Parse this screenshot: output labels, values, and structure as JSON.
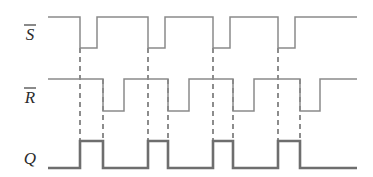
{
  "figure": {
    "type": "timing-diagram",
    "background_color": "#ffffff",
    "signal_color": "#8a8a8a",
    "output_color": "#6e6e6e",
    "dash_color": "#3a3a3a",
    "label_color": "#2b2b2b"
  },
  "axes": {
    "t_start": 48,
    "t_end": 357,
    "levels": {
      "sbar_high_y": 17,
      "sbar_low_y": 48,
      "rbar_high_y": 79,
      "rbar_low_y": 111,
      "q_high_y": 141,
      "q_low_y": 168
    }
  },
  "signals": [
    {
      "name": "S-bar",
      "label": "S",
      "overbar": true,
      "label_x": 30,
      "label_y": 40,
      "idle_level": "high",
      "active_low_pulses": [
        {
          "fall": 80,
          "rise": 97
        },
        {
          "fall": 148,
          "rise": 165
        },
        {
          "fall": 213,
          "rise": 230
        },
        {
          "fall": 278,
          "rise": 295
        }
      ]
    },
    {
      "name": "R-bar",
      "label": "R",
      "overbar": true,
      "label_x": 30,
      "label_y": 103,
      "idle_level": "high",
      "active_low_pulses": [
        {
          "fall": 103,
          "rise": 124
        },
        {
          "fall": 168,
          "rise": 189
        },
        {
          "fall": 233,
          "rise": 254
        },
        {
          "fall": 300,
          "rise": 320
        }
      ]
    },
    {
      "name": "Q",
      "label": "Q",
      "overbar": false,
      "label_x": 30,
      "label_y": 164,
      "idle_level": "low",
      "high_intervals": [
        {
          "rise": 80,
          "fall": 103
        },
        {
          "rise": 148,
          "fall": 168
        },
        {
          "rise": 213,
          "fall": 233
        },
        {
          "rise": 278,
          "fall": 300
        }
      ]
    }
  ],
  "dashed_markers": [
    {
      "x": 80,
      "y_top": 48,
      "y_bottom": 141,
      "source": "sbar-fall-1"
    },
    {
      "x": 103,
      "y_top": 79,
      "y_bottom": 141,
      "source": "rbar-fall-1"
    },
    {
      "x": 148,
      "y_top": 48,
      "y_bottom": 141,
      "source": "sbar-fall-2"
    },
    {
      "x": 168,
      "y_top": 79,
      "y_bottom": 141,
      "source": "rbar-fall-2"
    },
    {
      "x": 213,
      "y_top": 48,
      "y_bottom": 141,
      "source": "sbar-fall-3"
    },
    {
      "x": 233,
      "y_top": 79,
      "y_bottom": 141,
      "source": "rbar-fall-3"
    },
    {
      "x": 278,
      "y_top": 48,
      "y_bottom": 141,
      "source": "sbar-fall-4"
    },
    {
      "x": 300,
      "y_top": 79,
      "y_bottom": 141,
      "source": "rbar-fall-4"
    }
  ]
}
